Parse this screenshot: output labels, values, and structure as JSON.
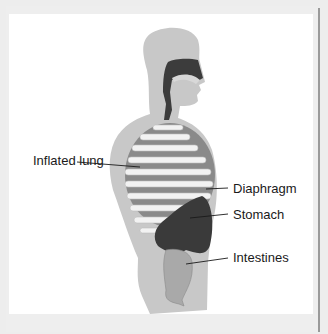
{
  "diagram": {
    "labels": [
      {
        "id": "inflated-lung",
        "text": "Inflated lung"
      },
      {
        "id": "diaphragm",
        "text": "Diaphragm"
      },
      {
        "id": "stomach",
        "text": "Stomach"
      },
      {
        "id": "intestines",
        "text": "Intestines"
      }
    ],
    "colors": {
      "frame": "#eeeeee",
      "panel": "#ffffff",
      "body": "#c8c8c8",
      "airway": "#3c3c3c",
      "rib": "#f2f2f2",
      "lung": "#8a8a8a",
      "stomach": "#3a3a3a",
      "intestines": "#a9a9a9",
      "text": "#1a1a1a"
    }
  }
}
